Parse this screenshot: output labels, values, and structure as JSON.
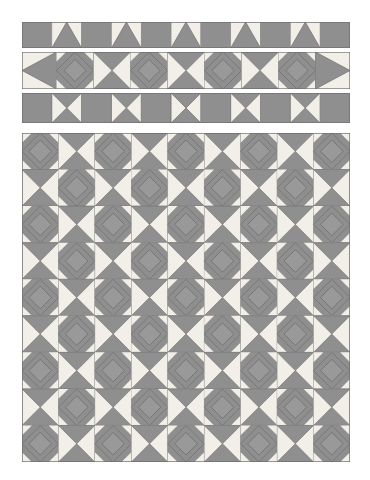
{
  "page": {
    "background": "#ffffff",
    "width": 370,
    "height": 480
  },
  "palette": {
    "gray": "#8f8f8f",
    "gray_dark": "#7d7d7d",
    "gray_mid": "#999999",
    "cream": "#f1efe8",
    "cream_light": "#f6f4ef",
    "outline": "#6f6f6f",
    "outline_soft": "#8a8a8a"
  },
  "bands": [
    {
      "name": "border-strip-triangle-peaks",
      "label": "Pieced border strip - peak triangles",
      "x": 22,
      "y": 22,
      "width": 328,
      "height": 26,
      "cells": 11,
      "pattern": [
        "solid",
        "peak",
        "solid",
        "peak",
        "solid",
        "peak",
        "solid",
        "peak",
        "solid",
        "peak",
        "solid"
      ],
      "block_types": {
        "solid": "solid gray square",
        "peak": "cream square with gray up-triangle"
      }
    },
    {
      "name": "border-strip-square-in-square",
      "label": "Pieced border strip - square in square / hourglass",
      "x": 22,
      "y": 52,
      "width": 328,
      "height": 37,
      "cells": 9,
      "pattern": [
        "halfdiamond-left",
        "sqinsq",
        "hourglass",
        "sqinsq",
        "hourglass",
        "sqinsq",
        "hourglass",
        "sqinsq",
        "halfdiamond-right"
      ],
      "block_types": {
        "sqinsq": "gray square with outlined gray diamond and cream corner triangles",
        "hourglass": "cream square with gray top and bottom triangles",
        "halfdiamond-left": "cream half block, left partial diamond",
        "halfdiamond-right": "cream half block, right partial diamond"
      }
    },
    {
      "name": "border-strip-hourglass",
      "label": "Pieced border strip - hourglass blocks",
      "x": 22,
      "y": 93,
      "width": 328,
      "height": 30,
      "cells": 11,
      "pattern": [
        "solid",
        "hourglass-x",
        "solid",
        "hourglass-x",
        "solid",
        "hourglass-x",
        "solid",
        "hourglass-x",
        "solid",
        "hourglass-x",
        "solid"
      ],
      "block_types": {
        "solid": "solid gray square",
        "hourglass-x": "gray square with cream left and right triangles"
      }
    }
  ],
  "main_panel": {
    "name": "quilt-body",
    "label": "Quilt body - alternating square-in-square and star blocks",
    "x": 22,
    "y": 133,
    "width": 328,
    "height": 329,
    "columns": 9,
    "rows": 9,
    "cell": 36.44,
    "layout_note": "checkerboard of square-in-square blocks (A) and hourglass star blocks (B)",
    "grid": [
      [
        "A",
        "B",
        "A",
        "B",
        "A",
        "B",
        "A",
        "B",
        "A"
      ],
      [
        "B",
        "A",
        "B",
        "A",
        "B",
        "A",
        "B",
        "A",
        "B"
      ],
      [
        "A",
        "B",
        "A",
        "B",
        "A",
        "B",
        "A",
        "B",
        "A"
      ],
      [
        "B",
        "A",
        "B",
        "A",
        "B",
        "A",
        "B",
        "A",
        "B"
      ],
      [
        "A",
        "B",
        "A",
        "B",
        "A",
        "B",
        "A",
        "B",
        "A"
      ],
      [
        "B",
        "A",
        "B",
        "A",
        "B",
        "A",
        "B",
        "A",
        "B"
      ],
      [
        "A",
        "B",
        "A",
        "B",
        "A",
        "B",
        "A",
        "B",
        "A"
      ],
      [
        "B",
        "A",
        "B",
        "A",
        "B",
        "A",
        "B",
        "A",
        "B"
      ],
      [
        "A",
        "B",
        "A",
        "B",
        "A",
        "B",
        "A",
        "B",
        "A"
      ]
    ],
    "block_legend": {
      "A": "square-in-square block: gray ground, outlined gray diamond center, cream corner triangles",
      "B": "star block: cream ground, gray diagonal quarter-square triangles forming an X"
    }
  }
}
